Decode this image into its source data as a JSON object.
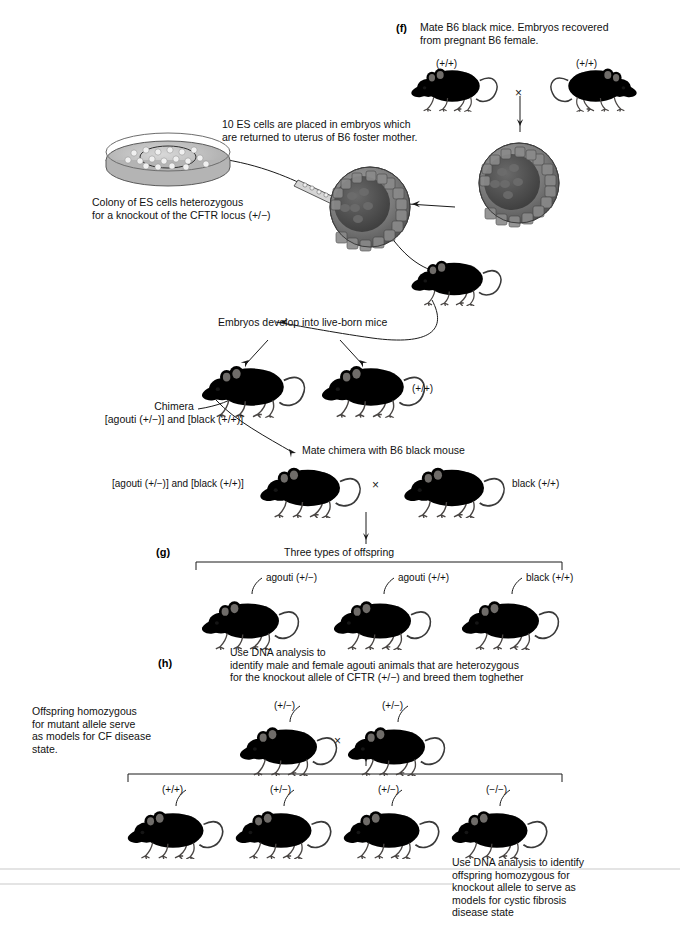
{
  "figure": {
    "width": 680,
    "height": 927,
    "background": "#ffffff",
    "ink": "#111111"
  },
  "steps": {
    "f": "(f)",
    "g": "(g)",
    "h": "(h)"
  },
  "captions": {
    "mate_b6": "Mate B6 black mice. Embryos recovered\nfrom pregnant B6 female.",
    "es_cells_placed": "10 ES cells are placed in embryos which\nare returned to uterus of B6 foster mother.",
    "colony": "Colony of ES cells heterozygous\nfor a knockout of the CFTR locus (+/−)",
    "embryos_develop": "Embryos develop into live-born mice",
    "chimera": "Chimera\n[agouti (+/−)] and [black (+/+)]",
    "mate_chimera": "Mate chimera with B6 black mouse",
    "chimera_left": "[agouti (+/−)] and [black (+/+)]",
    "three_types": "Three types of offspring",
    "dna_analysis_h": "Use DNA analysis to\nidentify male and female agouti animals that are heterozygous\nfor the knockout allele of CFTR (+/−) and breed them toghether",
    "offspring_homozygous": "Offspring homozygous\nfor mutant allele serve\nas models for CF disease\nstate.",
    "dna_analysis_final": "Use DNA analysis to identify\noffspring homozygous for\nknockout allele to serve as\nmodels for cystic fibrosis\ndisease state"
  },
  "genotypes": {
    "parent_male": "(+/+)",
    "parent_female": "(+/+)",
    "liveborn_black": "(+/+)",
    "b6_black_mate": "black (+/+)",
    "cross_symbol": "×"
  },
  "offspring_three": [
    {
      "label": "agouti (+/−)",
      "coat": "agouti"
    },
    {
      "label": "agouti (+/+)",
      "coat": "agouti"
    },
    {
      "label": "black (+/+)",
      "coat": "black"
    }
  ],
  "het_cross": [
    {
      "label": "(+/−)",
      "coat": "agouti"
    },
    {
      "label": "(+/−)",
      "coat": "agouti"
    }
  ],
  "final_offspring": [
    {
      "label": "(+/+)",
      "coat": "agouti"
    },
    {
      "label": "(+/−)",
      "coat": "agouti"
    },
    {
      "label": "(+/−)",
      "coat": "agouti"
    },
    {
      "label": "(−/−)",
      "coat": "agouti"
    }
  ],
  "icons": {
    "petri_dish": "petri-dish-icon",
    "blastocyst_injected": "blastocyst-injected-icon",
    "blastocyst_donor": "blastocyst-donor-icon",
    "micropipette": "micropipette-icon",
    "mouse_black": "mouse-black-icon",
    "mouse_agouti": "mouse-agouti-icon",
    "arrow": "arrow-icon",
    "bracket": "bracket-icon"
  },
  "colors": {
    "agouti_light": "#cdc7c0",
    "agouti_mid": "#a9a29a",
    "agouti_dark": "#6e6862",
    "black_mid": "#2b2b2b",
    "black_dark": "#0d0d0d",
    "dish_gray": "#b9b9b9",
    "blastocyst_gray": "#8e8e8e",
    "line": "#1a1a1a"
  }
}
